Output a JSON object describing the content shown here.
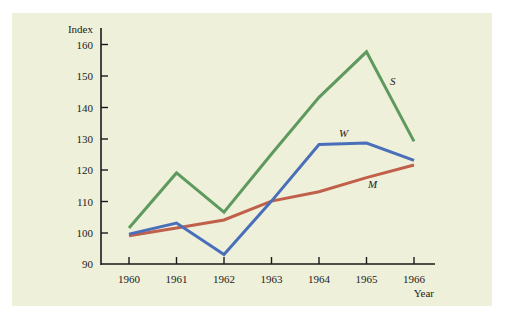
{
  "chart_data": {
    "type": "line",
    "title": "",
    "xlabel": "Year",
    "ylabel": "Index",
    "categories": [
      "1960",
      "1961",
      "1962",
      "1963",
      "1964",
      "1965",
      "1966"
    ],
    "ylim": [
      90,
      160
    ],
    "yticks": [
      90,
      100,
      110,
      120,
      130,
      140,
      150,
      160
    ],
    "grid": false,
    "legend": "inline labels",
    "series": [
      {
        "name": "S",
        "color": "#5e9a5e",
        "values": [
          101.5,
          119,
          106.5,
          125,
          143,
          157.5,
          129
        ]
      },
      {
        "name": "W",
        "color": "#4a6fba",
        "values": [
          99.5,
          103,
          93,
          110,
          128,
          128.5,
          123
        ]
      },
      {
        "name": "M",
        "color": "#c0604a",
        "values": [
          99,
          101.5,
          104,
          110,
          113,
          117.5,
          121.5
        ]
      }
    ]
  },
  "axis": {
    "y_title": "Index",
    "x_title": "Year",
    "y_tick_labels": [
      "160",
      "150",
      "140",
      "130",
      "120",
      "110",
      "100",
      "90"
    ],
    "x_tick_labels": [
      "1960",
      "1961",
      "1962",
      "1963",
      "1964",
      "1965",
      "1966"
    ]
  },
  "labels": {
    "S": "S",
    "W": "W",
    "M": "M"
  }
}
